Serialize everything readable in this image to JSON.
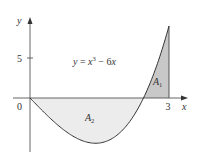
{
  "figure": {
    "equation": "y = x³ − 6x",
    "equation_parts": {
      "lhs": "y",
      "eq": " = ",
      "x": "x",
      "exp": "3",
      "rest": " − 6",
      "x2": "x"
    },
    "axes": {
      "x_label": "x",
      "y_label": "y",
      "origin_label": "0",
      "x_tick_label": "3",
      "y_tick_label": "5"
    },
    "regions": [
      {
        "name": "A",
        "sub": "1",
        "fill": "#c8c8c8",
        "description": "area above x-axis from √6 to 3"
      },
      {
        "name": "A",
        "sub": "2",
        "fill": "#ececec",
        "description": "area below x-axis from 0 to √6"
      }
    ],
    "colors": {
      "axis": "#555555",
      "curve": "#333333",
      "a1_fill": "#c8c8c8",
      "a2_fill": "#ececec"
    }
  },
  "chart_data": {
    "type": "line",
    "function": "x^3 - 6x",
    "x_range": [
      0,
      3
    ],
    "xlabel": "x",
    "ylabel": "y",
    "x_ticks": [
      {
        "value": 0,
        "label": "0"
      },
      {
        "value": 3,
        "label": "3"
      }
    ],
    "y_ticks": [
      {
        "value": 5,
        "label": "5"
      }
    ],
    "key_points": [
      {
        "x": 0,
        "y": 0
      },
      {
        "x": 1.414,
        "y": -5.657,
        "note": "local minimum"
      },
      {
        "x": 2.449,
        "y": 0,
        "note": "root √6"
      },
      {
        "x": 3,
        "y": 9
      }
    ],
    "shaded_regions": [
      {
        "label": "A1",
        "x_from": 2.449,
        "x_to": 3,
        "side": "above"
      },
      {
        "label": "A2",
        "x_from": 0,
        "x_to": 2.449,
        "side": "below"
      }
    ],
    "grid": false,
    "legend": null
  }
}
